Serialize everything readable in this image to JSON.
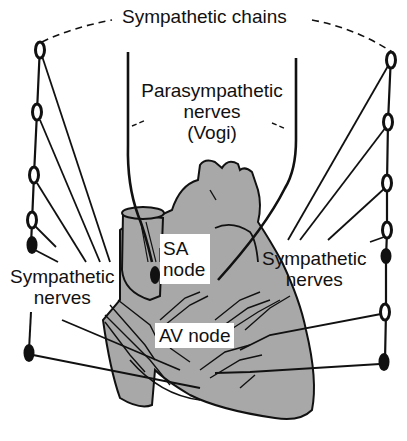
{
  "diagram": {
    "type": "anatomical-illustration",
    "colors": {
      "background": "#ffffff",
      "heart_fill": "#a8a8a8",
      "ink": "#111111"
    },
    "labels": {
      "sympathetic_chains": "Sympathetic chains",
      "parasympathetic_line1": "Parasympathetic",
      "parasympathetic_line2": "nerves",
      "parasympathetic_line3": "(Vogi)",
      "sa_node_line1": "SA",
      "sa_node_line2": "node",
      "av_node": "AV node",
      "left_sympathetic_line1": "Sympathetic",
      "left_sympathetic_line2": "nerves",
      "right_sympathetic_line1": "Sympathetic",
      "right_sympathetic_line2": "nerves"
    },
    "structures": {
      "left_chain_ganglia_count": 6,
      "right_chain_ganglia_count": 7
    }
  }
}
